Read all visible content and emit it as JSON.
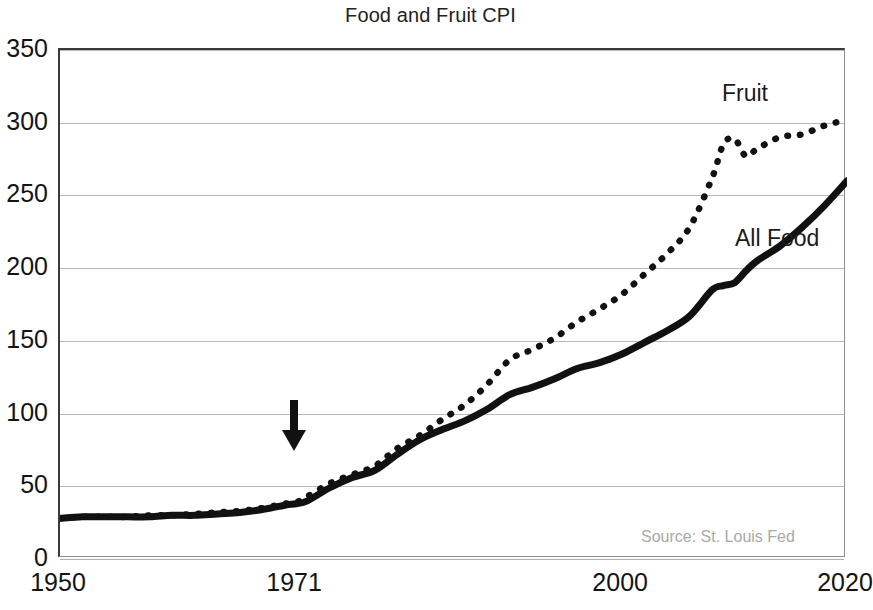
{
  "chart_data": {
    "type": "line",
    "title": "Food and Fruit CPI",
    "xlabel": "",
    "ylabel": "",
    "xlim": [
      1950,
      2020
    ],
    "ylim": [
      0,
      350
    ],
    "yticks": [
      0,
      50,
      100,
      150,
      200,
      250,
      300,
      350
    ],
    "xticks": [
      1950,
      1971,
      2000,
      2020
    ],
    "grid": "horizontal",
    "legend_position": "inline-annotation",
    "source_note": "Source: St. Louis Fed",
    "annotations": [
      {
        "name": "arrow-1971",
        "type": "down-arrow",
        "x": 1971,
        "y": 72,
        "label": ""
      }
    ],
    "x": [
      1950,
      1952,
      1954,
      1956,
      1958,
      1960,
      1962,
      1964,
      1966,
      1968,
      1970,
      1971,
      1972,
      1974,
      1976,
      1978,
      1980,
      1982,
      1984,
      1986,
      1988,
      1990,
      1992,
      1994,
      1996,
      1998,
      2000,
      2002,
      2004,
      2006,
      2008,
      2009,
      2010,
      2011,
      2012,
      2014,
      2016,
      2018,
      2020
    ],
    "series": [
      {
        "name": "All Food",
        "style": "solid",
        "color": "#111111",
        "values": [
          28,
          29,
          29,
          29,
          29,
          30,
          30,
          31,
          32,
          34,
          37,
          38,
          40,
          49,
          56,
          61,
          72,
          82,
          89,
          95,
          103,
          113,
          118,
          124,
          131,
          135,
          141,
          149,
          157,
          167,
          185,
          188,
          190,
          198,
          205,
          215,
          228,
          243,
          260
        ]
      },
      {
        "name": "Fruit",
        "style": "dotted",
        "color": "#111111",
        "values": [
          28,
          29,
          29,
          29,
          30,
          30,
          31,
          32,
          33,
          35,
          38,
          39,
          43,
          52,
          58,
          64,
          76,
          85,
          96,
          106,
          120,
          137,
          144,
          152,
          163,
          172,
          182,
          196,
          210,
          228,
          262,
          285,
          289,
          277,
          282,
          290,
          292,
          298,
          302
        ]
      }
    ]
  },
  "labels": {
    "title": "Food and Fruit CPI",
    "series_fruit": "Fruit",
    "series_all_food": "All Food",
    "source": "Source: St. Louis Fed"
  },
  "axis": {
    "y": [
      "350",
      "300",
      "250",
      "200",
      "150",
      "100",
      "50",
      "0"
    ],
    "x": [
      "1950",
      "1971",
      "2000",
      "2020"
    ]
  }
}
